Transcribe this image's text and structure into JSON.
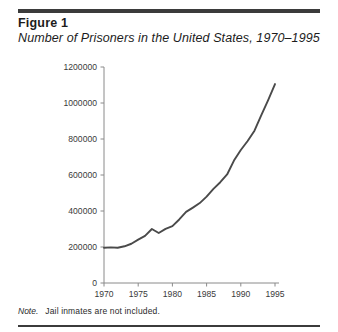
{
  "figure": {
    "label": "Figure 1",
    "title": "Number of Prisoners in the United States, 1970–1995",
    "note_label": "Note.",
    "note_text": "Jail inmates are not included."
  },
  "colors": {
    "rule": "#3b3b3b",
    "line": "#4a4a4a",
    "axis": "#8a8a8a",
    "text": "#1c1c1c"
  },
  "chart_data": {
    "type": "line",
    "title": "Number of Prisoners in the United States, 1970–1995",
    "xlabel": "",
    "ylabel": "",
    "xlim": [
      1969,
      1996
    ],
    "ylim": [
      0,
      1200000
    ],
    "xticks": [
      1970,
      1975,
      1980,
      1985,
      1990,
      1995
    ],
    "yticks": [
      0,
      200000,
      400000,
      600000,
      800000,
      1000000,
      1200000
    ],
    "ytick_labels": [
      "0",
      "200000",
      "400000",
      "600000",
      "800000",
      "1000000",
      "1200000"
    ],
    "xtick_labels": [
      "1970",
      "1975",
      "1980",
      "1985",
      "1990",
      "1995"
    ],
    "grid": false,
    "legend": null,
    "series": [
      {
        "name": "Prisoners",
        "x": [
          1970,
          1971,
          1972,
          1973,
          1974,
          1975,
          1976,
          1977,
          1978,
          1979,
          1980,
          1981,
          1982,
          1983,
          1984,
          1985,
          1986,
          1987,
          1988,
          1989,
          1990,
          1991,
          1992,
          1993,
          1994,
          1995
        ],
        "values": [
          196000,
          198000,
          196000,
          204000,
          218000,
          241000,
          262000,
          300000,
          278000,
          301000,
          316000,
          353000,
          395000,
          419000,
          444000,
          480000,
          523000,
          560000,
          603000,
          680000,
          739000,
          789000,
          846000,
          932000,
          1016000,
          1105000
        ]
      }
    ]
  }
}
